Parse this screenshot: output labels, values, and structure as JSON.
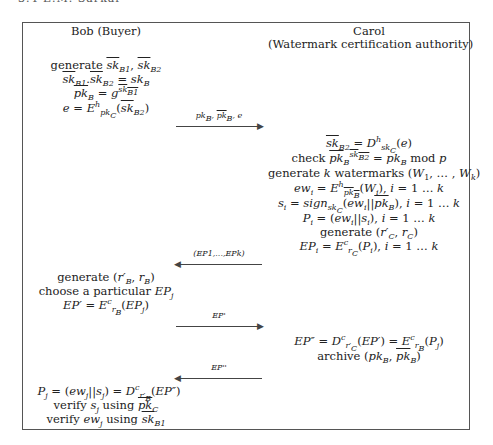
{
  "running_head": "3.4     E.M. Sarkar",
  "parties": {
    "bob": "Bob (Buyer)",
    "carol": "Carol",
    "carol_role": "(Watermark certification authority)"
  },
  "bob_steps_1": [
    "generate sk̄B1, sk̄B2",
    "sk̄B1.sk̄B2 = skB",
    "p̄kB = g^(sk̄B1)",
    "e = E^h_pkC(sk̄B2)"
  ],
  "messages": [
    {
      "label": "pkB, p̄kB, e",
      "direction": "right"
    },
    {
      "label": "(EP1,...,EPk)",
      "direction": "left"
    },
    {
      "label": "EP'",
      "direction": "right"
    },
    {
      "label": "EP''",
      "direction": "left"
    }
  ],
  "carol_steps_1": [
    "sk̄B2 = D^h_skC(e)",
    "check p̄kB^(sk̄B2) = pkB mod p",
    "generate k watermarks (W1, ..., Wk)",
    "ewi = E^h_p̄kB(Wi), i = 1...k",
    "si = sign_skC(ewi||p̄kB), i = 1...k",
    "Pi = (ewi||si), i = 1...k",
    "generate (r'C, rC)",
    "EPi = E^c_rC(Pi), i = 1...k"
  ],
  "bob_steps_2": [
    "generate (r'B, rB)",
    "choose a particular EPj",
    "EP' = E^c_rB(EPj)"
  ],
  "carol_steps_2": [
    "EP'' = D^c_r'C(EP') = E^c_rB(Pj)",
    "archive (pkB, p̄kB)"
  ],
  "bob_steps_3": [
    "Pj = (ewj||sj) = D^c_r'B(EP'')",
    "verify sj using pkC",
    "verify ewj using sk̄B1"
  ]
}
